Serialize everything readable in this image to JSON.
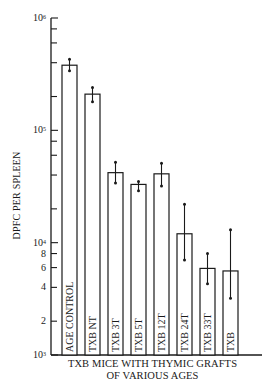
{
  "chart_data": {
    "type": "bar",
    "title": "",
    "xlabel": "TXB MICE WITH THYMIC GRAFTS OF VARIOUS AGES",
    "xlabel_lines": [
      "TXB MICE WITH THYMIC GRAFTS",
      "OF VARIOUS AGES"
    ],
    "ylabel": "DPFC PER SPLEEN",
    "yscale": "log",
    "ylim": [
      1000,
      1000000
    ],
    "y_tick_labels": [
      "10^3",
      "2",
      "4",
      "6",
      "8",
      "10^4",
      "10^5",
      "10^6"
    ],
    "grid": false,
    "legend": null,
    "categories": [
      "AGE CONTROL",
      "TXB NT",
      "TXB 3T",
      "TXB 5T",
      "TXB 12T",
      "TXB 24T",
      "TXB 33T",
      "TXB"
    ],
    "values": [
      380000,
      210000,
      42000,
      33000,
      41000,
      12000,
      5900,
      5600
    ],
    "error_low": [
      340000,
      180000,
      34000,
      29000,
      32000,
      7000,
      4300,
      3200
    ],
    "error_high": [
      430000,
      240000,
      52000,
      35000,
      51000,
      22000,
      8000,
      13000
    ]
  },
  "axis": {
    "decades": [
      {
        "exp": "6",
        "label": "10",
        "value": 1000000
      },
      {
        "exp": "5",
        "label": "10",
        "value": 100000
      },
      {
        "exp": "4",
        "label": "10",
        "value": 10000
      },
      {
        "exp": "3",
        "label": "10",
        "value": 1000
      }
    ],
    "minor_labels": [
      {
        "label": "8",
        "value": 8000
      },
      {
        "label": "6",
        "value": 6000
      },
      {
        "label": "4",
        "value": 4000
      },
      {
        "label": "2",
        "value": 2000
      }
    ]
  },
  "colors": {
    "ink": "#1a1a1a",
    "bar_fill": "#ffffff",
    "background": "#ffffff"
  }
}
